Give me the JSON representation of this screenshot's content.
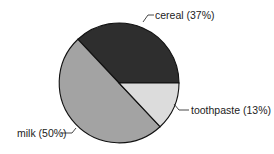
{
  "chart_data": {
    "type": "pie",
    "title": "",
    "categories": [
      "cereal",
      "milk",
      "toothpaste"
    ],
    "values": [
      37,
      50,
      13
    ],
    "labels": [
      "cereal (37%)",
      "milk (50%)",
      "toothpaste (13%)"
    ],
    "colors": [
      "#2e2e2e",
      "#a3a3a3",
      "#dcdcdc"
    ],
    "start_angle_deg": 0,
    "direction": "counterclockwise",
    "legend": "none",
    "label_style": "leader-lines"
  }
}
